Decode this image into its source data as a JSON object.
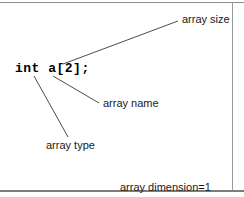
{
  "figure": {
    "background_color": "#ffffff",
    "border_color": "#8d8d8d",
    "line_color": "#4d4d4d",
    "text_color": "#1a1a1a"
  },
  "code": {
    "declaration": "int a[2];"
  },
  "annotations": {
    "array_size": "array size",
    "array_name": "array name",
    "array_type": "array type",
    "dimension_line1": "array dimension=1",
    "dimension_line2": "(1 pair of brackets)"
  },
  "leaders": [
    {
      "name": "array-size-leader",
      "x1": 63,
      "y1": 64,
      "x2": 178,
      "y2": 21
    },
    {
      "name": "array-name-leader",
      "x1": 53,
      "y1": 76,
      "x2": 99,
      "y2": 103
    },
    {
      "name": "array-type-leader",
      "x1": 34,
      "y1": 76,
      "x2": 68,
      "y2": 137
    }
  ]
}
